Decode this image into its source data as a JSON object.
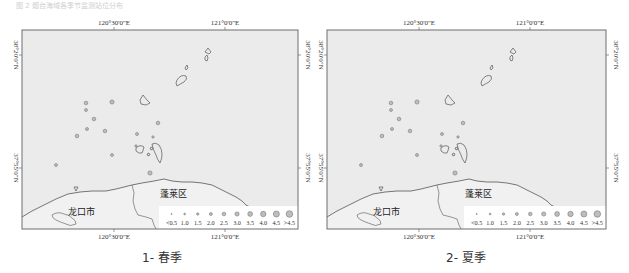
{
  "figure": {
    "top_note": "图 2  烟台海域各季节监测站位分布",
    "colors": {
      "sea": "#ebebeb",
      "frame": "#6e6e6e",
      "coast": "#555555",
      "marker_fill": "#bdbdbd",
      "marker_stroke": "#7a7a7a",
      "text": "#333333"
    },
    "axes": {
      "top_ticks": [
        "120°30'0\"E",
        "121°0'0\"E"
      ],
      "bottom_ticks": [
        "120°30'0\"E",
        "121°0'0\"E"
      ],
      "left_ticks": [
        "38°20'0\"N",
        "37°55'0\"N"
      ],
      "right_ticks": [
        "38°20'0\"N",
        "37°55'0\"N"
      ]
    },
    "legend": {
      "labels": [
        "<0.5",
        "1.0",
        "1.5",
        "2.0",
        "2.5",
        "3.0",
        "3.5",
        "4.0",
        "4.5",
        ">4.5"
      ],
      "radii": [
        0.6,
        0.9,
        1.2,
        1.5,
        1.8,
        2.1,
        2.4,
        2.7,
        3.0,
        3.3
      ]
    },
    "place_labels": {
      "longkou": "龙口市",
      "penglai": "蓬莱区"
    },
    "panels": [
      {
        "id": "spring",
        "caption": "1- 春季",
        "stations": [
          {
            "x": 90,
            "y": 72,
            "s": 5
          },
          {
            "x": 64,
            "y": 73,
            "s": 4
          },
          {
            "x": 64,
            "y": 80,
            "s": 3
          },
          {
            "x": 72,
            "y": 89,
            "s": 4
          },
          {
            "x": 65,
            "y": 99,
            "s": 3
          },
          {
            "x": 83,
            "y": 101,
            "s": 4
          },
          {
            "x": 115,
            "y": 104,
            "s": 3
          },
          {
            "x": 131,
            "y": 107,
            "s": 2
          },
          {
            "x": 114,
            "y": 116,
            "s": 2
          },
          {
            "x": 55,
            "y": 106,
            "s": 4
          },
          {
            "x": 90,
            "y": 125,
            "s": 3
          },
          {
            "x": 34,
            "y": 135,
            "s": 3
          },
          {
            "x": 128,
            "y": 143,
            "s": 5
          },
          {
            "x": 136,
            "y": 93,
            "s": 4
          }
        ]
      },
      {
        "id": "summer",
        "caption": "2- 夏季",
        "stations": [
          {
            "x": 90,
            "y": 72,
            "s": 5
          },
          {
            "x": 64,
            "y": 73,
            "s": 4
          },
          {
            "x": 64,
            "y": 80,
            "s": 3
          },
          {
            "x": 72,
            "y": 89,
            "s": 4
          },
          {
            "x": 65,
            "y": 99,
            "s": 3
          },
          {
            "x": 83,
            "y": 101,
            "s": 4
          },
          {
            "x": 115,
            "y": 104,
            "s": 3
          },
          {
            "x": 131,
            "y": 107,
            "s": 2
          },
          {
            "x": 114,
            "y": 116,
            "s": 2
          },
          {
            "x": 55,
            "y": 106,
            "s": 4
          },
          {
            "x": 90,
            "y": 125,
            "s": 3
          },
          {
            "x": 34,
            "y": 135,
            "s": 3
          },
          {
            "x": 128,
            "y": 143,
            "s": 5
          },
          {
            "x": 136,
            "y": 93,
            "s": 4
          }
        ]
      }
    ]
  }
}
